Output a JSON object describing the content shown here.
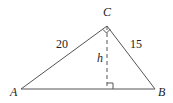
{
  "diagram": {
    "type": "right-triangle-altitude",
    "vertices": {
      "A": {
        "label": "A",
        "x": 21,
        "y": 89
      },
      "B": {
        "label": "B",
        "x": 155,
        "y": 89
      },
      "C": {
        "label": "C",
        "x": 107,
        "y": 26
      }
    },
    "sides": {
      "AC": {
        "label": "20"
      },
      "CB": {
        "label": "15"
      }
    },
    "altitude": {
      "label": "h",
      "foot_x": 107,
      "foot_y": 89,
      "style": "dashed"
    },
    "right_angles": [
      "C",
      "foot"
    ],
    "stroke_color": "#555555"
  }
}
